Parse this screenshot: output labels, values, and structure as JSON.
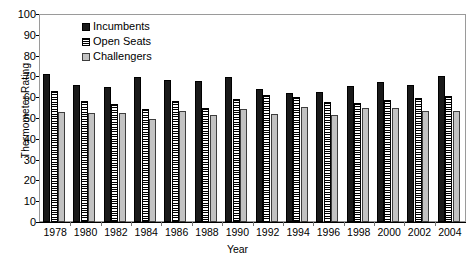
{
  "chart_data": {
    "type": "bar",
    "title": "",
    "xlabel": "Year",
    "ylabel": "Thermometer Rating",
    "ylim": [
      0,
      100
    ],
    "yticks": [
      0,
      10,
      20,
      30,
      40,
      50,
      60,
      70,
      80,
      90,
      100
    ],
    "grid": false,
    "legend_position": "top-left inside plot",
    "categories": [
      "1978",
      "1980",
      "1982",
      "1984",
      "1986",
      "1988",
      "1990",
      "1992",
      "1994",
      "1996",
      "1998",
      "2000",
      "2002",
      "2004"
    ],
    "series": [
      {
        "name": "Incumbents",
        "color": "#1a1a1a",
        "pattern": "solid-black",
        "values": [
          71,
          66,
          65,
          69.5,
          68.5,
          68,
          69.5,
          64,
          62,
          62.5,
          65.5,
          67.5,
          66,
          70
        ]
      },
      {
        "name": "Open Seats",
        "color": "#ffffff",
        "pattern": "horizontal-stripes",
        "values": [
          63,
          58,
          56.5,
          54.5,
          58,
          55,
          59,
          61,
          60,
          57.5,
          57,
          58.5,
          59.5,
          60.5
        ]
      },
      {
        "name": "Challengers",
        "color": "#c2c2c2",
        "pattern": "solid-gray",
        "values": [
          53,
          52.5,
          52.5,
          49.5,
          53.5,
          51.5,
          54.5,
          52,
          55.5,
          51.5,
          55,
          55,
          53.5,
          53.5
        ]
      }
    ]
  }
}
